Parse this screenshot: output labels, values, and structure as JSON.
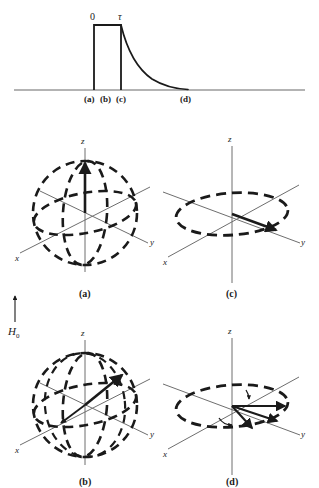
{
  "figure": {
    "background_color": "#ffffff",
    "ink_color": "#1a1a1a",
    "axis_color": "#6e6e6e",
    "baseline_color": "#9a9a9a",
    "width": 319,
    "height": 488
  },
  "pulse_diagram": {
    "name": "pulse-timing-diagram",
    "start_label": "0",
    "tau_label": "τ",
    "baseline_labels": [
      {
        "text": "(a)",
        "x": 88
      },
      {
        "text": "(b)",
        "x": 104
      },
      {
        "text": "(c)",
        "x": 120
      },
      {
        "text": "(d)",
        "x": 185
      }
    ],
    "shape": {
      "type": "rectangular-pulse-with-exponential-decay",
      "pulse_start_x": 94,
      "pulse_end_x": 121,
      "pulse_top_y": 25,
      "baseline_y": 90,
      "decay_end_x": 188,
      "decay_tail_y": 89
    }
  },
  "field_marker": {
    "name": "static-field-arrow",
    "label": "H",
    "subscript": "0",
    "direction": "up"
  },
  "panels": [
    {
      "id": "a",
      "caption": "(a)",
      "name": "bloch-sphere-panel-a",
      "shows_sphere": true,
      "axes": {
        "z": "z",
        "x": "x",
        "y": "y"
      },
      "magnetization": {
        "description": "equilibrium magnetization along +z",
        "direction": "up-z"
      },
      "center": {
        "x": 85,
        "y": 213
      },
      "radius": {
        "rx": 52,
        "ry": 52
      }
    },
    {
      "id": "b",
      "caption": "(b)",
      "name": "bloch-sphere-panel-b",
      "shows_sphere": true,
      "axes": {
        "z": "z",
        "x": "x",
        "y": "y"
      },
      "magnetization": {
        "description": "magnetization tipped away from z toward transverse plane",
        "direction": "tilted"
      },
      "center": {
        "x": 85,
        "y": 405
      },
      "radius": {
        "rx": 52,
        "ry": 52
      }
    },
    {
      "id": "c",
      "caption": "(c)",
      "name": "bloch-sphere-panel-c",
      "shows_sphere": false,
      "axes": {
        "z": "z",
        "x": "x",
        "y": "y"
      },
      "magnetization": {
        "description": "magnetization fully in the transverse xy-plane",
        "direction": "in-plane"
      },
      "center": {
        "x": 232,
        "y": 213
      },
      "radius": {
        "rx": 56,
        "ry": 21
      }
    },
    {
      "id": "d",
      "caption": "(d)",
      "name": "bloch-sphere-panel-d",
      "shows_sphere": false,
      "axes": {
        "z": "z",
        "x": "x",
        "y": "y"
      },
      "magnetization": {
        "description": "transverse magnetization dephasing into a fan of spin vectors",
        "direction": "fanning-in-plane",
        "fan_count": 3
      },
      "center": {
        "x": 232,
        "y": 405
      },
      "radius": {
        "rx": 56,
        "ry": 21
      }
    }
  ]
}
